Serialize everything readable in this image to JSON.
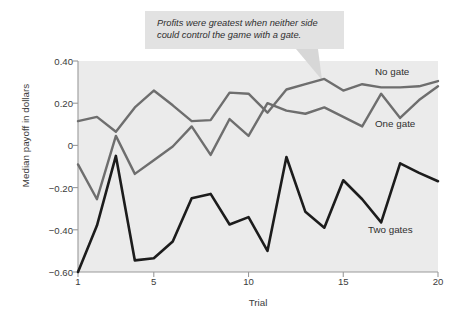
{
  "callout": {
    "text": "Profits were greatest when neither side\ncould control the game with a gate.",
    "background": "#e2e2e2"
  },
  "chart_data": {
    "type": "line",
    "title": "",
    "xlabel": "Trial",
    "ylabel": "Median payoff in dollars",
    "xlim": [
      1,
      20
    ],
    "ylim": [
      -0.6,
      0.4
    ],
    "xticks": [
      "1",
      "5",
      "10",
      "15",
      "20"
    ],
    "xtick_values": [
      1,
      5,
      10,
      15,
      20
    ],
    "yticks": [
      "0.40",
      "0.20",
      "0",
      "−0.20",
      "−0.40",
      "−0.60"
    ],
    "ytick_values": [
      0.4,
      0.2,
      0,
      -0.2,
      -0.4,
      -0.6
    ],
    "grid": false,
    "legend_position": "inline-right",
    "plot_background": "#ebebeb",
    "x": [
      1,
      2,
      3,
      4,
      5,
      6,
      7,
      8,
      9,
      10,
      11,
      12,
      13,
      14,
      15,
      16,
      17,
      18,
      19,
      20
    ],
    "series": [
      {
        "name": "No gate",
        "color": "#6e6e6e",
        "width": 2.4,
        "values": [
          0.115,
          0.135,
          0.065,
          0.18,
          0.26,
          0.19,
          0.115,
          0.12,
          0.25,
          0.245,
          0.155,
          0.265,
          0.29,
          0.315,
          0.26,
          0.29,
          0.275,
          0.275,
          0.28,
          0.305
        ]
      },
      {
        "name": "One gate",
        "color": "#6e6e6e",
        "width": 2.4,
        "values": [
          -0.09,
          -0.255,
          0.045,
          -0.135,
          -0.07,
          -0.005,
          0.09,
          -0.045,
          0.125,
          0.045,
          0.2,
          0.165,
          0.15,
          0.18,
          0.135,
          0.09,
          0.245,
          0.13,
          0.215,
          0.28
        ]
      },
      {
        "name": "Two gates",
        "color": "#1c1c1c",
        "width": 2.6,
        "values": [
          -0.6,
          -0.38,
          -0.05,
          -0.545,
          -0.535,
          -0.455,
          -0.25,
          -0.23,
          -0.375,
          -0.34,
          -0.5,
          -0.055,
          -0.315,
          -0.39,
          -0.165,
          -0.255,
          -0.365,
          -0.085,
          -0.13,
          -0.17
        ]
      }
    ],
    "annotations": [
      {
        "text": "No gate",
        "series": "No gate"
      },
      {
        "text": "One gate",
        "series": "One gate"
      },
      {
        "text": "Two gates",
        "series": "Two gates"
      }
    ]
  },
  "axis_color": "#9a9a9a",
  "tail_color": "#d7d7d7"
}
